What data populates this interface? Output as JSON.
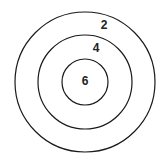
{
  "diagram": {
    "type": "concentric-circles",
    "rings": [
      {
        "name": "outer",
        "label": "2"
      },
      {
        "name": "middle",
        "label": "4"
      },
      {
        "name": "inner",
        "label": "6"
      }
    ]
  }
}
